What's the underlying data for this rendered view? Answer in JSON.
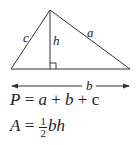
{
  "diagram": {
    "type": "triangle-with-altitude",
    "labels": {
      "side_left": "c",
      "side_right": "a",
      "altitude": "h",
      "base": "b"
    },
    "vertices": {
      "left": [
        11,
        69
      ],
      "apex": [
        50,
        10
      ],
      "right": [
        130,
        69
      ]
    },
    "colors": {
      "stroke": "#333333"
    }
  },
  "formulas": {
    "perimeter": {
      "lhs": "P",
      "eq": " = ",
      "a": "a",
      "plus1": " + ",
      "b": "b",
      "plus2": " + ",
      "c": "c"
    },
    "area": {
      "lhs": "A",
      "eq": " = ",
      "num": "1",
      "den": "2",
      "rest": "bh"
    }
  }
}
